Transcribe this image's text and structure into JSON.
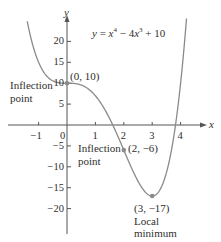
{
  "chart_data": {
    "type": "line",
    "equation": {
      "lhs": "y",
      "terms": [
        "x",
        "4",
        "4x",
        "3",
        "10"
      ]
    },
    "xlabel": "x",
    "ylabel": "y",
    "xlim": [
      -1.6,
      4.6
    ],
    "ylim": [
      -25,
      26
    ],
    "x_ticks": [
      -1,
      0,
      1,
      2,
      3,
      4
    ],
    "y_ticks": [
      20,
      15,
      10,
      5,
      -5,
      -10,
      -15,
      -20
    ],
    "x_tick_labels": [
      "−1",
      "0",
      "1",
      "2",
      "3",
      "4"
    ],
    "y_tick_labels": [
      "20",
      "15",
      "10",
      "5",
      "−5",
      "−10",
      "−15",
      "−20"
    ],
    "grid": false,
    "series": [
      {
        "name": "y = x^4 - 4x^3 + 10",
        "function": "x^4 - 4*x^3 + 10",
        "x_range": [
          -1.4,
          4.25
        ]
      }
    ],
    "annotations": [
      {
        "point": [
          0,
          10
        ],
        "label": "(0, 10)",
        "note": "Inflection point"
      },
      {
        "point": [
          2,
          -6
        ],
        "label": "(2, −6)",
        "note": "Inflection point"
      },
      {
        "point": [
          3,
          -17
        ],
        "label": "(3, −17)",
        "note": "Local minimum"
      }
    ]
  },
  "labels": {
    "eq_y": "y",
    "eq_eq": " = ",
    "eq_x1": "x",
    "eq_p1": "4",
    "eq_minus": " − 4",
    "eq_x2": "x",
    "eq_p2": "3",
    "eq_plus": " + 10",
    "axis_x": "x",
    "axis_y": "y",
    "pt1": "(0, 10)",
    "pt1_note_a": "Inflection",
    "pt1_note_b": "point",
    "pt2": "(2, −6)",
    "pt2_note_a": "Inflection",
    "pt2_note_b": "point",
    "pt3": "(3, −17)",
    "pt3_note_a": "Local",
    "pt3_note_b": "minimum"
  },
  "colors": {
    "curve": "#8a8a8a",
    "axis": "#555555",
    "point": "#8a8a8a",
    "text": "#2f2f2f"
  }
}
